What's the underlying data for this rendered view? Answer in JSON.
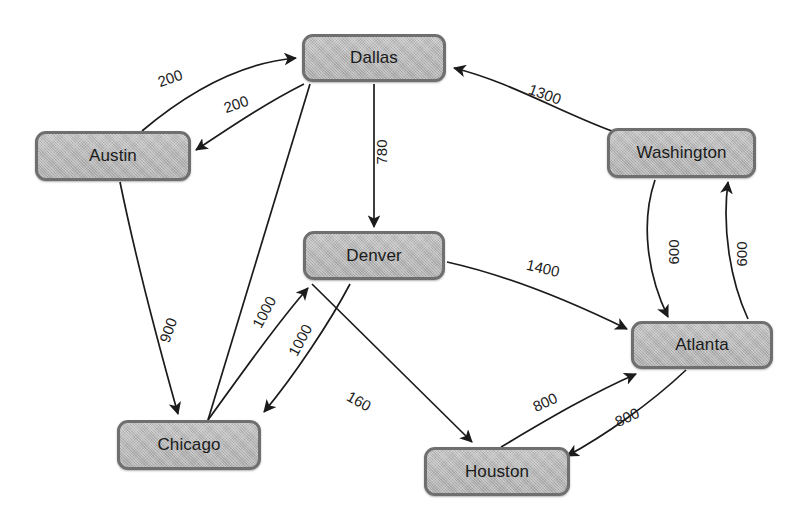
{
  "diagram": {
    "background_color": "#ffffff",
    "node_fill_color": "#b6b6b6",
    "node_border_color": "#6f6f6f",
    "edge_color": "#1b1b1b",
    "label_color": "#1b1b1b"
  },
  "nodes": [
    {
      "id": "dallas",
      "label": "Dallas",
      "x": 302,
      "y": 34,
      "w": 144,
      "h": 48
    },
    {
      "id": "austin",
      "label": "Austin",
      "x": 35,
      "y": 131,
      "w": 156,
      "h": 50
    },
    {
      "id": "washington",
      "label": "Washington",
      "x": 607,
      "y": 128,
      "w": 149,
      "h": 50
    },
    {
      "id": "denver",
      "label": "Denver",
      "x": 303,
      "y": 231,
      "w": 142,
      "h": 49
    },
    {
      "id": "atlanta",
      "label": "Atlanta",
      "x": 631,
      "y": 321,
      "w": 142,
      "h": 48
    },
    {
      "id": "chicago",
      "label": "Chicago",
      "x": 117,
      "y": 420,
      "w": 144,
      "h": 50
    },
    {
      "id": "houston",
      "label": "Houston",
      "x": 424,
      "y": 447,
      "w": 146,
      "h": 49
    }
  ],
  "edges": [
    {
      "id": "austin-dallas",
      "from": "Austin",
      "to": "Dallas",
      "weight": "200",
      "label_x": 170,
      "label_y": 78,
      "label_rot": -19
    },
    {
      "id": "dallas-austin",
      "from": "Dallas",
      "to": "Austin",
      "weight": "200",
      "label_x": 236,
      "label_y": 104,
      "label_rot": -19
    },
    {
      "id": "dallas-denver",
      "from": "Dallas",
      "to": "Denver",
      "weight": "780",
      "label_x": 381,
      "label_y": 152,
      "label_rot": -90
    },
    {
      "id": "washington-dallas",
      "from": "Washington",
      "to": "Dallas",
      "weight": "1300",
      "label_x": 545,
      "label_y": 94,
      "label_rot": 20
    },
    {
      "id": "washington-atlanta",
      "from": "Washington",
      "to": "Atlanta",
      "weight": "600",
      "label_x": 673,
      "label_y": 252,
      "label_rot": -90
    },
    {
      "id": "atlanta-washington",
      "from": "Atlanta",
      "to": "Washington",
      "weight": "600",
      "label_x": 741,
      "label_y": 254,
      "label_rot": -90
    },
    {
      "id": "denver-atlanta",
      "from": "Denver",
      "to": "Atlanta",
      "weight": "1400",
      "label_x": 543,
      "label_y": 268,
      "label_rot": 13
    },
    {
      "id": "austin-chicago",
      "from": "Austin",
      "to": "Chicago",
      "weight": "900",
      "label_x": 168,
      "label_y": 330,
      "label_rot": -70
    },
    {
      "id": "chicago-denver",
      "from": "Chicago",
      "to": "Denver",
      "weight": "1000",
      "label_x": 264,
      "label_y": 312,
      "label_rot": -62
    },
    {
      "id": "denver-chicago",
      "from": "Denver",
      "to": "Chicago",
      "weight": "1000",
      "label_x": 300,
      "label_y": 340,
      "label_rot": -62
    },
    {
      "id": "denver-houston",
      "from": "Denver",
      "to": "Houston",
      "weight": "160",
      "label_x": 359,
      "label_y": 401,
      "label_rot": 29
    },
    {
      "id": "houston-atlanta",
      "from": "Houston",
      "to": "Atlanta",
      "weight": "800",
      "label_x": 545,
      "label_y": 402,
      "label_rot": -25
    },
    {
      "id": "atlanta-houston",
      "from": "Atlanta",
      "to": "Houston",
      "weight": "800",
      "label_x": 627,
      "label_y": 417,
      "label_rot": -25
    }
  ],
  "chart_data": {
    "type": "diagram",
    "subtype": "weighted-directed-graph",
    "vertices": [
      "Dallas",
      "Austin",
      "Washington",
      "Denver",
      "Atlanta",
      "Chicago",
      "Houston"
    ],
    "directed": true,
    "weighted": true,
    "edge_list": [
      {
        "source": "Austin",
        "target": "Dallas",
        "weight": 200
      },
      {
        "source": "Dallas",
        "target": "Austin",
        "weight": 200
      },
      {
        "source": "Dallas",
        "target": "Denver",
        "weight": 780
      },
      {
        "source": "Dallas",
        "target": "Chicago",
        "weight": 900
      },
      {
        "source": "Washington",
        "target": "Dallas",
        "weight": 1300
      },
      {
        "source": "Washington",
        "target": "Atlanta",
        "weight": 600
      },
      {
        "source": "Atlanta",
        "target": "Washington",
        "weight": 600
      },
      {
        "source": "Denver",
        "target": "Atlanta",
        "weight": 1400
      },
      {
        "source": "Austin",
        "target": "Chicago",
        "weight": 900
      },
      {
        "source": "Chicago",
        "target": "Denver",
        "weight": 1000
      },
      {
        "source": "Denver",
        "target": "Chicago",
        "weight": 1000
      },
      {
        "source": "Denver",
        "target": "Houston",
        "weight": 160
      },
      {
        "source": "Houston",
        "target": "Atlanta",
        "weight": 800
      },
      {
        "source": "Atlanta",
        "target": "Houston",
        "weight": 800
      }
    ]
  }
}
